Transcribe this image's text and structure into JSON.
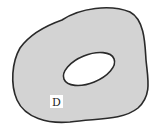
{
  "diagram": {
    "region_label": "D",
    "colors": {
      "region_fill": "#d3d3d3",
      "boundary_stroke": "#2a2a2a",
      "hole_fill": "#ffffff",
      "label_bg": "#ffffff"
    }
  }
}
